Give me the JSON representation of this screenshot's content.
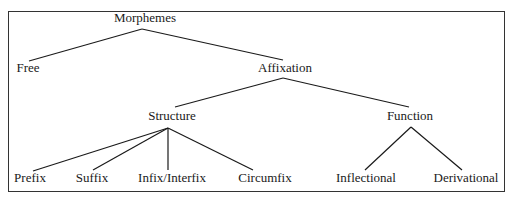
{
  "diagram": {
    "type": "tree",
    "title": "Morphemes",
    "nodes": {
      "root": {
        "label": "Morphemes",
        "x": 145,
        "y": 11
      },
      "free": {
        "label": "Free",
        "x": 28,
        "y": 61
      },
      "affixation": {
        "label": "Affixation",
        "x": 285,
        "y": 61
      },
      "structure": {
        "label": "Structure",
        "x": 172,
        "y": 109
      },
      "function": {
        "label": "Function",
        "x": 410,
        "y": 109
      },
      "prefix": {
        "label": "Prefix",
        "x": 30,
        "y": 171
      },
      "suffix": {
        "label": "Suffix",
        "x": 92,
        "y": 171
      },
      "infix": {
        "label": "Infix/Interfix",
        "x": 172,
        "y": 171
      },
      "circumfix": {
        "label": "Circumfix",
        "x": 265,
        "y": 171
      },
      "inflectional": {
        "label": "Inflectional",
        "x": 366,
        "y": 171
      },
      "derivational": {
        "label": "Derivational",
        "x": 466,
        "y": 171
      }
    },
    "edges": [
      {
        "from": "root",
        "to": "free",
        "x1": 142,
        "y1": 29,
        "x2": 29,
        "y2": 61
      },
      {
        "from": "root",
        "to": "affixation",
        "x1": 142,
        "y1": 29,
        "x2": 283,
        "y2": 60
      },
      {
        "from": "affixation",
        "to": "structure",
        "x1": 283,
        "y1": 78,
        "x2": 175,
        "y2": 107
      },
      {
        "from": "affixation",
        "to": "function",
        "x1": 283,
        "y1": 78,
        "x2": 409,
        "y2": 107
      },
      {
        "from": "structure",
        "to": "prefix",
        "x1": 168,
        "y1": 128,
        "x2": 33,
        "y2": 171
      },
      {
        "from": "structure",
        "to": "suffix",
        "x1": 168,
        "y1": 128,
        "x2": 93,
        "y2": 170
      },
      {
        "from": "structure",
        "to": "infix",
        "x1": 168,
        "y1": 128,
        "x2": 168,
        "y2": 170
      },
      {
        "from": "structure",
        "to": "circumfix",
        "x1": 168,
        "y1": 128,
        "x2": 253,
        "y2": 170
      },
      {
        "from": "function",
        "to": "inflectional",
        "x1": 411,
        "y1": 127,
        "x2": 365,
        "y2": 170
      },
      {
        "from": "function",
        "to": "derivational",
        "x1": 411,
        "y1": 127,
        "x2": 462,
        "y2": 170
      }
    ]
  }
}
